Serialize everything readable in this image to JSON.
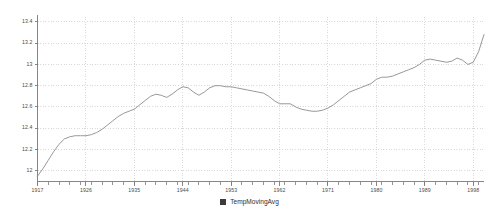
{
  "chart_data": {
    "type": "line",
    "title": "",
    "subtitle": "",
    "xlabel": "",
    "ylabel": "",
    "xlim": [
      1917,
      2000
    ],
    "ylim": [
      11.9,
      13.45
    ],
    "grid": true,
    "legend_position": "bottom",
    "legend": [
      "TempMovingAvg"
    ],
    "series": [
      {
        "name": "TempMovingAvg",
        "color": "#8c8c8c",
        "x": [
          1917,
          1918,
          1919,
          1920,
          1921,
          1922,
          1923,
          1924,
          1925,
          1926,
          1927,
          1928,
          1929,
          1930,
          1931,
          1932,
          1933,
          1934,
          1935,
          1936,
          1937,
          1938,
          1939,
          1940,
          1941,
          1942,
          1943,
          1944,
          1945,
          1946,
          1947,
          1948,
          1949,
          1950,
          1951,
          1952,
          1953,
          1954,
          1955,
          1956,
          1957,
          1958,
          1959,
          1960,
          1961,
          1962,
          1963,
          1964,
          1965,
          1966,
          1967,
          1968,
          1969,
          1970,
          1971,
          1972,
          1973,
          1974,
          1975,
          1976,
          1977,
          1978,
          1979,
          1980,
          1981,
          1982,
          1983,
          1984,
          1985,
          1986,
          1987,
          1988,
          1989,
          1990,
          1991,
          1992,
          1993,
          1994,
          1995,
          1996,
          1997,
          1998,
          1999,
          2000
        ],
        "values": [
          11.95,
          12.02,
          12.1,
          12.18,
          12.25,
          12.3,
          12.32,
          12.33,
          12.33,
          12.33,
          12.34,
          12.36,
          12.39,
          12.43,
          12.47,
          12.51,
          12.54,
          12.56,
          12.58,
          12.62,
          12.66,
          12.7,
          12.72,
          12.71,
          12.69,
          12.72,
          12.76,
          12.79,
          12.78,
          12.74,
          12.71,
          12.74,
          12.78,
          12.8,
          12.8,
          12.79,
          12.79,
          12.78,
          12.77,
          12.76,
          12.75,
          12.74,
          12.73,
          12.7,
          12.66,
          12.63,
          12.63,
          12.63,
          12.6,
          12.58,
          12.57,
          12.56,
          12.56,
          12.57,
          12.59,
          12.62,
          12.66,
          12.7,
          12.74,
          12.76,
          12.78,
          12.8,
          12.82,
          12.86,
          12.88,
          12.88,
          12.89,
          12.91,
          12.93,
          12.95,
          12.97,
          13.0,
          13.04,
          13.05,
          13.04,
          13.03,
          13.02,
          13.03,
          13.06,
          13.04,
          13.0,
          13.02,
          13.12,
          13.28
        ]
      }
    ],
    "y_ticks": [
      {
        "value": 13.4,
        "label": "13.4"
      },
      {
        "value": 13.2,
        "label": "13.2"
      },
      {
        "value": 13.0,
        "label": "13"
      },
      {
        "value": 12.8,
        "label": "12.8"
      },
      {
        "value": 12.6,
        "label": "12.6"
      },
      {
        "value": 12.4,
        "label": "12.4"
      },
      {
        "value": 12.2,
        "label": "12.2"
      },
      {
        "value": 12.0,
        "label": "12"
      }
    ],
    "x_ticks_major": [
      {
        "value": 1917,
        "label": "1917"
      },
      {
        "value": 1926,
        "label": "1926"
      },
      {
        "value": 1935,
        "label": "1935"
      },
      {
        "value": 1944,
        "label": "1944"
      },
      {
        "value": 1953,
        "label": "1953"
      },
      {
        "value": 1962,
        "label": "1962"
      },
      {
        "value": 1971,
        "label": "1971"
      },
      {
        "value": 1980,
        "label": "1980"
      },
      {
        "value": 1989,
        "label": "1989"
      },
      {
        "value": 1998,
        "label": "1998"
      }
    ],
    "x_minor_step": 2,
    "colors": {
      "line": "#8c8c8c",
      "grid": "#c9c9c9",
      "axis": "#7a7a7a",
      "legend_swatch": "#3b3b3b",
      "background": "#ffffff",
      "tick_text": "#4a4a4a"
    }
  },
  "legend_entry": {
    "label": "TempMovingAvg"
  }
}
